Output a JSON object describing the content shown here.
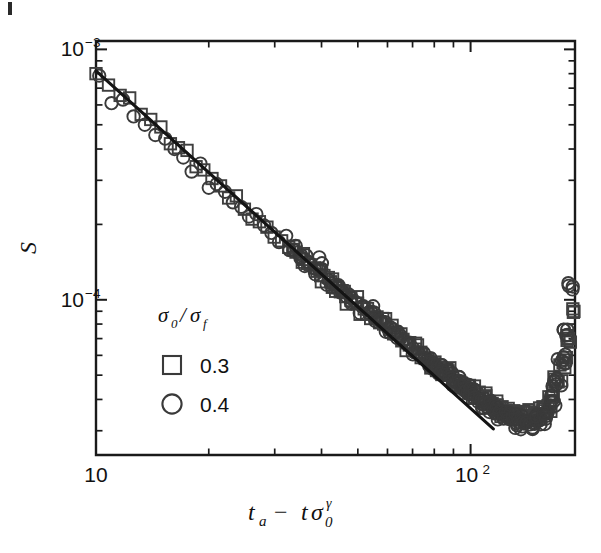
{
  "figure": {
    "background_color": "#ffffff",
    "axis_color": "#1a1a1a",
    "marker_color": "#3a3a3a",
    "fit_line_color": "#141414"
  },
  "axes": {
    "x_label": "t_a − tσ₀^γ",
    "x_label_parts": {
      "t": "t",
      "sub_a": "a",
      "minus": "−",
      "t2": "t",
      "sigma": "σ",
      "sub_0": "0",
      "sup_gamma": "γ"
    },
    "y_label": "S",
    "x_ticks": [
      {
        "value": 10,
        "label": "10",
        "mantissa": "10",
        "exponent": ""
      },
      {
        "value": 100,
        "label": "10²",
        "mantissa": "10",
        "exponent": "2"
      }
    ],
    "y_ticks": [
      {
        "value": 0.001,
        "label": "10⁻³",
        "mantissa": "10",
        "exponent": "−3"
      },
      {
        "value": 0.0001,
        "label": "10⁻⁴",
        "mantissa": "10",
        "exponent": "−4"
      }
    ]
  },
  "legend": {
    "title": "σ₀/σ_f",
    "title_parts": {
      "sigma1": "σ",
      "sub1": "0",
      "slash": "/",
      "sigma2": "σ",
      "sub2": "f"
    },
    "entries": [
      {
        "marker": "square",
        "label": "0.3"
      },
      {
        "marker": "circle",
        "label": "0.4"
      }
    ]
  },
  "chart_data": {
    "type": "scatter",
    "title": "",
    "xlabel": "t_a − tσ₀^γ",
    "ylabel": "S",
    "xscale": "log",
    "yscale": "log",
    "xlim": [
      10,
      190
    ],
    "ylim": [
      2.4e-05,
      0.00108
    ],
    "grid": false,
    "legend_position": "inside-left-center",
    "fit_line": {
      "type": "power_law",
      "x": [
        10.0,
        115.0
      ],
      "y": [
        0.00082,
        3.05e-05
      ],
      "exponent": -1.35,
      "description": "solid black power-law fit line"
    },
    "series": [
      {
        "name": "0.3",
        "marker": "square",
        "x": [
          10.0,
          10.8,
          11.6,
          12.3,
          13.2,
          14.0,
          14.9,
          15.8,
          16.6,
          17.5,
          18.5,
          19.4,
          20.4,
          21.5,
          22.6,
          23.7,
          24.9,
          26.1,
          27.3,
          28.6,
          29.9,
          31.3,
          32.7,
          34.2,
          35.7,
          37.3,
          38.9,
          40.6,
          42.3,
          44.1,
          46.0,
          47.9,
          49.9,
          52.0,
          54.1,
          56.3,
          58.6,
          61.0,
          63.4,
          66.0,
          68.6,
          71.3,
          74.1,
          77.0,
          80.0,
          83.1,
          86.3,
          89.6,
          93.0,
          96.5,
          100.1,
          103.8,
          107.6,
          111.5,
          115.5,
          119.6,
          123.8,
          128.1,
          132.5,
          137.0,
          141.6,
          146.3,
          151.1,
          156.0,
          161.0,
          166.1,
          171.3,
          176.6,
          182.0,
          187.5
        ],
        "y": [
          0.0008,
          0.00072,
          0.000655,
          0.00064,
          0.00055,
          0.000525,
          0.00049,
          0.00042,
          0.000405,
          0.000395,
          0.00034,
          0.00033,
          0.000305,
          0.000285,
          0.000255,
          0.00026,
          0.00023,
          0.00021,
          0.000205,
          0.000195,
          0.000178,
          0.000172,
          0.000162,
          0.000155,
          0.000145,
          0.000138,
          0.00013,
          0.000125,
          0.000118,
          0.000112,
          0.000108,
          0.000102,
          9.7e-05,
          9.2e-05,
          8.8e-05,
          8.4e-05,
          8e-05,
          7.6e-05,
          7.3e-05,
          6.95e-05,
          6.6e-05,
          6.35e-05,
          6.05e-05,
          5.8e-05,
          5.55e-05,
          5.3e-05,
          5.1e-05,
          4.9e-05,
          4.7e-05,
          4.5e-05,
          4.35e-05,
          4.2e-05,
          4.05e-05,
          3.92e-05,
          3.8e-05,
          3.7e-05,
          3.62e-05,
          3.55e-05,
          3.5e-05,
          3.46e-05,
          3.44e-05,
          3.45e-05,
          3.5e-05,
          3.6e-05,
          3.78e-05,
          4.1e-05,
          4.7e-05,
          5.6e-05,
          7e-05,
          9.2e-05
        ]
      },
      {
        "name": "0.4",
        "marker": "circle",
        "x": [
          10.2,
          11.0,
          11.8,
          12.6,
          13.5,
          14.4,
          15.3,
          16.2,
          17.1,
          18.0,
          19.0,
          20.0,
          21.0,
          22.1,
          23.2,
          24.4,
          25.6,
          26.8,
          28.1,
          29.4,
          30.8,
          32.2,
          33.7,
          35.2,
          36.8,
          38.4,
          40.1,
          41.8,
          43.6,
          45.4,
          47.3,
          49.3,
          51.3,
          53.4,
          55.6,
          57.8,
          60.1,
          62.5,
          65.0,
          67.6,
          70.2,
          72.9,
          75.7,
          78.6,
          81.6,
          84.7,
          87.9,
          91.2,
          94.6,
          98.1,
          101.7,
          105.4,
          109.2,
          113.1,
          117.2,
          121.3,
          125.6,
          130.0,
          134.5,
          139.1,
          143.9,
          148.8,
          153.8,
          159.0,
          164.3,
          169.8,
          175.4,
          181.2,
          187.1
        ],
        "y": [
          0.000785,
          0.00061,
          0.00063,
          0.00054,
          0.0005,
          0.000455,
          0.00044,
          0.0004,
          0.00037,
          0.000325,
          0.00035,
          0.00028,
          0.00029,
          0.00027,
          0.000245,
          0.000235,
          0.000215,
          0.00022,
          0.000198,
          0.000185,
          0.00017,
          0.00018,
          0.000158,
          0.000148,
          0.000142,
          0.000133,
          0.00014,
          0.00012,
          0.000115,
          0.000108,
          0.000105,
          9.8e-05,
          9.4e-05,
          8.9e-05,
          8.5e-05,
          8.2e-05,
          7.7e-05,
          7.4e-05,
          7e-05,
          6.7e-05,
          6.4e-05,
          6.1e-05,
          5.85e-05,
          5.6e-05,
          5.35e-05,
          5.15e-05,
          4.95e-05,
          4.72e-05,
          4.52e-05,
          4.35e-05,
          4.18e-05,
          4.02e-05,
          3.88e-05,
          3.75e-05,
          3.62e-05,
          3.5e-05,
          3.4e-05,
          3.32e-05,
          3.25e-05,
          3.2e-05,
          3.18e-05,
          3.22e-05,
          3.35e-05,
          3.55e-05,
          3.95e-05,
          4.6e-05,
          5.7e-05,
          7.6e-05,
          0.00011
        ]
      }
    ]
  }
}
